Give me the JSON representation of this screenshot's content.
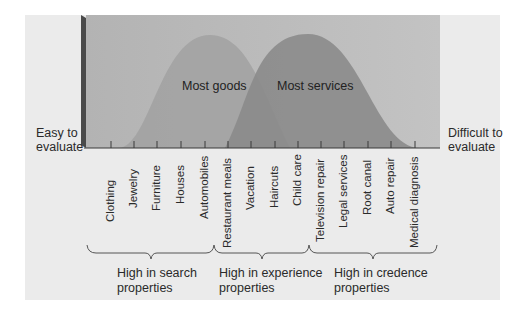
{
  "diagram": {
    "left_label": [
      "Easy to",
      "evaluate"
    ],
    "right_label": [
      "Difficult to",
      "evaluate"
    ],
    "curves": [
      {
        "label": "Most goods",
        "color": "#a3a3a3"
      },
      {
        "label": "Most services",
        "color": "#8a8a8a"
      }
    ],
    "items": [
      "Clothing",
      "Jewelry",
      "Furniture",
      "Houses",
      "Automobiles",
      "Restaurant meals",
      "Vacation",
      "Haircuts",
      "Child care",
      "Television repair",
      "Legal services",
      "Root canal",
      "Auto repair",
      "Medical diagnosis"
    ],
    "groups": [
      {
        "line1": "High in search",
        "line2": "properties"
      },
      {
        "line1": "High in experience",
        "line2": "properties"
      },
      {
        "line1": "High in credence",
        "line2": "properties"
      }
    ],
    "colors": {
      "panel_bg": "#ebebeb",
      "chart_bg": "#b9b9b9",
      "chart_left_edge": "#4a4a4a",
      "goods_curve": "#a3a3a3",
      "services_curve": "#8a8a8a",
      "overlap": "#7f7f7f"
    }
  }
}
